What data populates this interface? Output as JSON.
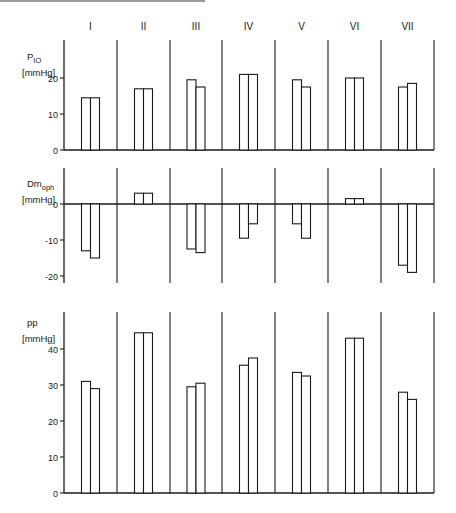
{
  "chart_data": [
    {
      "type": "bar",
      "panel": "top",
      "ylabel": "P_IO",
      "ylabel_main": "P",
      "ylabel_sub": "IO",
      "yunit": "[mmHg]",
      "categories": [
        "I",
        "II",
        "III",
        "IV",
        "V",
        "VI",
        "VII"
      ],
      "series": [
        {
          "name": "bar 1",
          "values": [
            14.5,
            17,
            19.5,
            21,
            19.5,
            20,
            17.5
          ]
        },
        {
          "name": "bar 2",
          "values": [
            14.5,
            17,
            17.5,
            21,
            17.5,
            20,
            18.5
          ]
        }
      ],
      "yticks": [
        0,
        10,
        20
      ],
      "ylim": [
        0,
        30
      ],
      "grid": false,
      "legend": "none"
    },
    {
      "type": "bar",
      "panel": "middle",
      "ylabel": "Dm_oph",
      "ylabel_main": "Dm",
      "ylabel_sub": "oph",
      "yunit": "[mmHg]",
      "categories": [
        "I",
        "II",
        "III",
        "IV",
        "V",
        "VI",
        "VII"
      ],
      "series": [
        {
          "name": "bar 1",
          "values": [
            -13,
            3,
            -12.5,
            -9.5,
            -5.5,
            1.5,
            -17
          ]
        },
        {
          "name": "bar 2",
          "values": [
            -15,
            3,
            -13.5,
            -5.5,
            -9.5,
            1.5,
            -19
          ]
        }
      ],
      "yticks": [
        0,
        -10,
        -20
      ],
      "ylim": [
        -22,
        10
      ],
      "grid": false,
      "legend": "none"
    },
    {
      "type": "bar",
      "panel": "bottom",
      "ylabel": "pp",
      "ylabel_main": "pp",
      "ylabel_sub": "",
      "yunit": "[mmHg]",
      "categories": [
        "I",
        "II",
        "III",
        "IV",
        "V",
        "VI",
        "VII"
      ],
      "series": [
        {
          "name": "bar 1",
          "values": [
            31,
            44.5,
            29.5,
            35.5,
            33.5,
            43,
            28
          ]
        },
        {
          "name": "bar 2",
          "values": [
            29,
            44.5,
            30.5,
            37.5,
            32.5,
            43,
            26
          ]
        }
      ],
      "yticks": [
        0,
        10,
        20,
        30,
        40
      ],
      "ylim": [
        0,
        50
      ],
      "grid": false,
      "legend": "none"
    }
  ],
  "colors": {
    "ink": "#1a1a1a",
    "background": "#ffffff",
    "bar_fill": "#ffffff"
  }
}
